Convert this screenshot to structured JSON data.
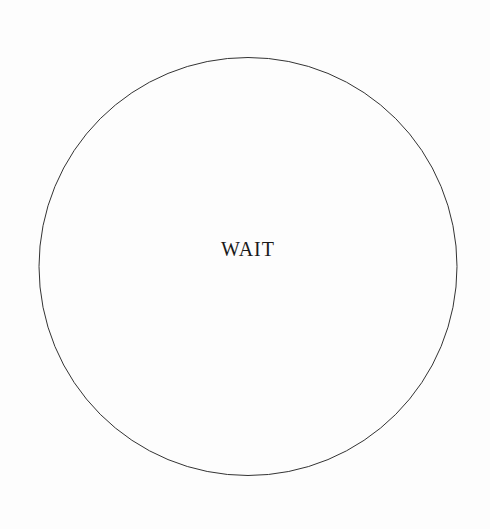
{
  "sign": {
    "label": "WAIT",
    "shape": "circle",
    "stroke_color": "#333333",
    "background_color": "#fdfdfd",
    "text_color": "#1a1a1a"
  }
}
